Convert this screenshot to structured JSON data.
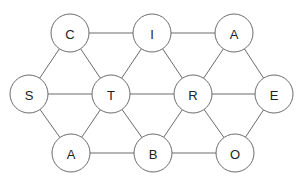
{
  "diagram": {
    "type": "letter-graph",
    "colors": {
      "stroke": "#6b6b6b",
      "fill": "#ffffff",
      "text": "#222222"
    },
    "radius": 19,
    "nodes": [
      {
        "id": "c",
        "label": "C",
        "x": 70,
        "y": 33
      },
      {
        "id": "i",
        "label": "I",
        "x": 152,
        "y": 33
      },
      {
        "id": "a1",
        "label": "A",
        "x": 234,
        "y": 33
      },
      {
        "id": "s",
        "label": "S",
        "x": 29,
        "y": 94
      },
      {
        "id": "t",
        "label": "T",
        "x": 111,
        "y": 94
      },
      {
        "id": "r",
        "label": "R",
        "x": 193,
        "y": 94
      },
      {
        "id": "e",
        "label": "E",
        "x": 274,
        "y": 94
      },
      {
        "id": "a2",
        "label": "A",
        "x": 71,
        "y": 153
      },
      {
        "id": "b",
        "label": "B",
        "x": 153,
        "y": 153
      },
      {
        "id": "o",
        "label": "O",
        "x": 235,
        "y": 153
      }
    ],
    "edges": [
      [
        "c",
        "i"
      ],
      [
        "i",
        "a1"
      ],
      [
        "s",
        "t"
      ],
      [
        "t",
        "r"
      ],
      [
        "r",
        "e"
      ],
      [
        "a2",
        "b"
      ],
      [
        "b",
        "o"
      ],
      [
        "c",
        "s"
      ],
      [
        "c",
        "t"
      ],
      [
        "i",
        "t"
      ],
      [
        "i",
        "r"
      ],
      [
        "a1",
        "r"
      ],
      [
        "a1",
        "e"
      ],
      [
        "s",
        "a2"
      ],
      [
        "t",
        "a2"
      ],
      [
        "t",
        "b"
      ],
      [
        "r",
        "b"
      ],
      [
        "r",
        "o"
      ],
      [
        "e",
        "o"
      ]
    ]
  }
}
